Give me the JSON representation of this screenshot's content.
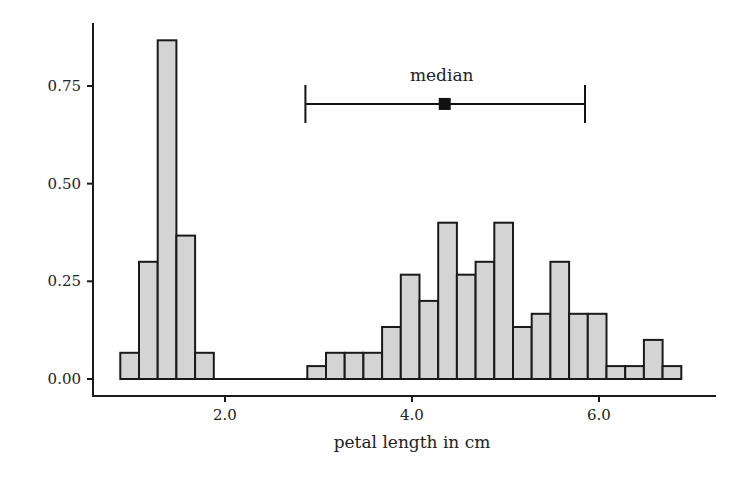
{
  "chart_data": {
    "type": "bar",
    "subtype": "histogram",
    "title": "",
    "xlabel": "petal length in cm",
    "ylabel": "",
    "xlim": [
      0.6,
      7.85
    ],
    "ylim": [
      -0.045,
      0.91
    ],
    "xticks": [
      2.0,
      4.0,
      6.0
    ],
    "xtick_labels": [
      "2.0",
      "4.0",
      "6.0"
    ],
    "yticks": [
      0.0,
      0.25,
      0.5,
      0.75
    ],
    "ytick_labels": [
      "0.00",
      "0.25",
      "0.50",
      "0.75"
    ],
    "grid": false,
    "legend": null,
    "bin_width": 0.2,
    "bins": [
      {
        "x0": 0.88,
        "density": 0.067
      },
      {
        "x0": 1.08,
        "density": 0.3
      },
      {
        "x0": 1.28,
        "density": 0.867
      },
      {
        "x0": 1.48,
        "density": 0.367
      },
      {
        "x0": 1.68,
        "density": 0.067
      },
      {
        "x0": 2.88,
        "density": 0.033
      },
      {
        "x0": 3.08,
        "density": 0.067
      },
      {
        "x0": 3.28,
        "density": 0.067
      },
      {
        "x0": 3.48,
        "density": 0.067
      },
      {
        "x0": 3.68,
        "density": 0.133
      },
      {
        "x0": 3.88,
        "density": 0.267
      },
      {
        "x0": 4.08,
        "density": 0.2
      },
      {
        "x0": 4.28,
        "density": 0.4
      },
      {
        "x0": 4.48,
        "density": 0.267
      },
      {
        "x0": 4.68,
        "density": 0.3
      },
      {
        "x0": 4.88,
        "density": 0.4
      },
      {
        "x0": 5.08,
        "density": 0.133
      },
      {
        "x0": 5.28,
        "density": 0.167
      },
      {
        "x0": 5.48,
        "density": 0.3
      },
      {
        "x0": 5.68,
        "density": 0.167
      },
      {
        "x0": 5.88,
        "density": 0.167
      },
      {
        "x0": 6.08,
        "density": 0.033
      },
      {
        "x0": 6.28,
        "density": 0.033
      },
      {
        "x0": 6.48,
        "density": 0.1
      },
      {
        "x0": 6.68,
        "density": 0.033
      }
    ],
    "annotations": [
      {
        "label": "median",
        "marker": "square",
        "center": 4.35,
        "low": 2.86,
        "high": 5.85,
        "y": 0.704,
        "label_position": "above"
      },
      {
        "label": "arithmetic mean",
        "marker": "circle",
        "center": 3.76,
        "low": 1.99,
        "high": 5.53,
        "y": 0.553,
        "label_position": "below"
      }
    ],
    "colors": {
      "bar_fill": "#d4d4d4",
      "bar_stroke": "#1a1a1a",
      "axis": "#1a1a1a",
      "marker": "#111111",
      "label_box_stroke": "#222222",
      "label_box_fill": "#ffffff"
    }
  }
}
